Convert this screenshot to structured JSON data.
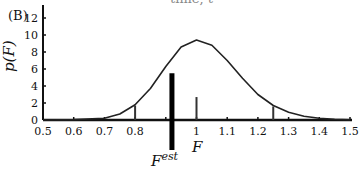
{
  "panel_label": "(B)",
  "top_cutoff_text": "time, t",
  "chart_data": {
    "type": "line",
    "title": "",
    "xlabel": "F",
    "ylabel": "p(F)",
    "xlim": [
      0.5,
      1.5
    ],
    "ylim": [
      0,
      13
    ],
    "x_ticks": [
      "0.5",
      "0.6",
      "0.7",
      "0.8",
      "",
      "1",
      "1.1",
      "1.2",
      "1.3",
      "1.4",
      "1.5"
    ],
    "y_ticks": [
      "0",
      "2",
      "4",
      "6",
      "8",
      "10",
      "12"
    ],
    "grid": false,
    "series": [
      {
        "name": "p(F) density",
        "type": "line",
        "x": [
          0.5,
          0.6,
          0.7,
          0.75,
          0.8,
          0.85,
          0.9,
          0.95,
          1.0,
          1.05,
          1.1,
          1.15,
          1.2,
          1.25,
          1.3,
          1.35,
          1.4,
          1.45,
          1.5
        ],
        "y": [
          0.0,
          0.05,
          0.2,
          0.7,
          1.8,
          3.7,
          6.3,
          8.6,
          9.4,
          8.8,
          7.0,
          4.9,
          3.0,
          1.7,
          0.9,
          0.45,
          0.2,
          0.08,
          0.03
        ]
      },
      {
        "name": "sample bars",
        "type": "bar",
        "x": [
          0.8,
          1.0,
          1.25
        ],
        "y": [
          1.7,
          2.7,
          1.6
        ]
      },
      {
        "name": "F_est",
        "type": "bar",
        "x": [
          0.92
        ],
        "y": [
          5.5
        ]
      }
    ],
    "annotations": [
      "F^est",
      "F"
    ]
  },
  "labels": {
    "est_base": "F",
    "est_sup": "est",
    "x_axis": "F",
    "y_axis": "p(F)"
  }
}
